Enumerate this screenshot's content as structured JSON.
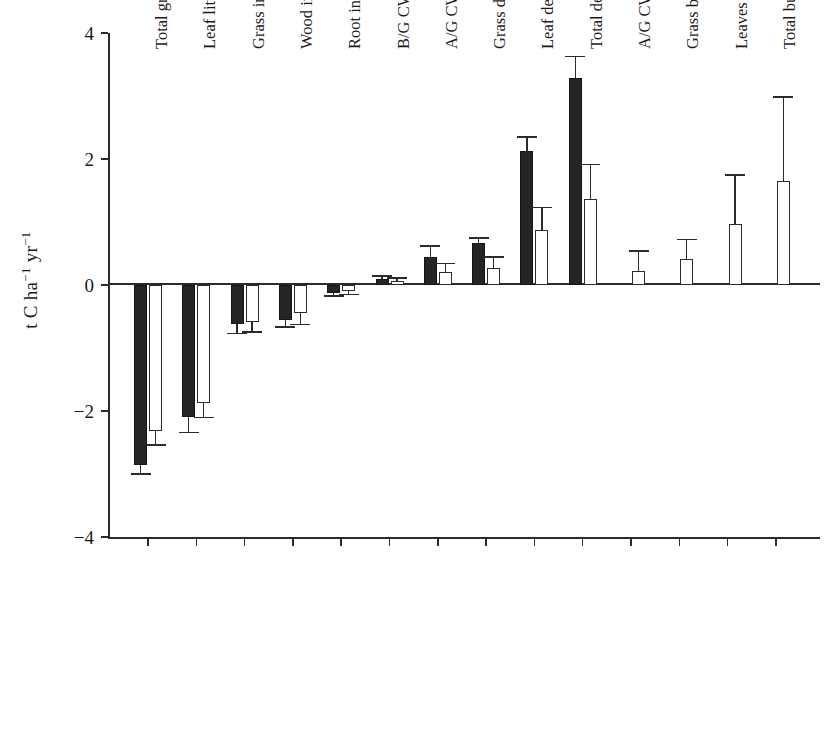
{
  "chart_data": {
    "type": "bar",
    "title": "",
    "subtitle": "",
    "xlabel": "",
    "ylabel": "t C ha−1 yr−1",
    "ylabel_parts": {
      "prefix": "t C ha",
      "sup1": "−1",
      "mid": " yr",
      "sup2": "−1"
    },
    "ylim": [
      -4,
      4
    ],
    "yticks": [
      4,
      2,
      0,
      -2,
      -4
    ],
    "ytick_labels": [
      "4",
      "2",
      "0",
      "−2",
      "−4"
    ],
    "grid": false,
    "legend": "none",
    "legend_entries": [
      {
        "name": "solid",
        "style": "filled-black"
      },
      {
        "name": "open",
        "style": "open-white"
      }
    ],
    "categories": [
      "Total growth",
      "Leaf litter input",
      "Grass input",
      "Wood input",
      "Root input",
      "B/G CWD decomp",
      "A/G CWD decomp",
      "Grass decomp",
      "Leaf decomp",
      "Total decomp",
      "A/G CWD burned",
      "Grass burned",
      "Leaves burned",
      "Total burned"
    ],
    "series": [
      {
        "name": "solid",
        "values": [
          -2.85,
          -2.1,
          -0.62,
          -0.55,
          -0.12,
          0.1,
          0.45,
          0.67,
          2.13,
          3.29,
          null,
          null,
          null,
          null
        ],
        "errors": [
          0.15,
          0.24,
          0.15,
          0.12,
          0.05,
          0.04,
          0.17,
          0.08,
          0.22,
          0.34,
          null,
          null,
          null,
          null
        ]
      },
      {
        "name": "open",
        "values": [
          -2.32,
          -1.88,
          -0.58,
          -0.45,
          -0.1,
          0.07,
          0.21,
          0.27,
          0.87,
          1.37,
          0.22,
          0.42,
          0.97,
          1.65
        ],
        "errors": [
          0.22,
          0.22,
          0.17,
          0.18,
          0.05,
          0.04,
          0.13,
          0.17,
          0.36,
          0.54,
          0.32,
          0.3,
          0.78,
          1.33
        ]
      }
    ]
  }
}
